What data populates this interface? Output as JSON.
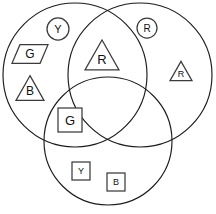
{
  "diagram": {
    "type": "venn-diagram",
    "background_color": "#ffffff",
    "outline_color": "#1b1b1b",
    "shape_outline_color": "#3b3b3b",
    "shape_fill_color": "#ffffff",
    "canvas": {
      "width": 216,
      "height": 214
    },
    "sets": [
      {
        "name": "left-circle",
        "cx": 75,
        "cy": 75,
        "r": 72
      },
      {
        "name": "right-circle",
        "cx": 140,
        "cy": 75,
        "r": 72
      },
      {
        "name": "bottom-circle",
        "cx": 108,
        "cy": 141,
        "r": 64
      }
    ],
    "objects": [
      {
        "id": "circle-y",
        "shape": "circle",
        "label": "Y",
        "region": "left-circle-only",
        "cx": 58,
        "cy": 29,
        "size": 22,
        "font_size": 11
      },
      {
        "id": "parallelogram-g",
        "shape": "parallelogram",
        "label": "G",
        "region": "left-circle-only",
        "cx": 30,
        "cy": 54,
        "size": 36,
        "font_size": 12
      },
      {
        "id": "triangle-b",
        "shape": "triangle",
        "label": "B",
        "region": "left-circle-only",
        "cx": 30,
        "cy": 88,
        "size": 28,
        "font_size": 12
      },
      {
        "id": "triangle-r-center",
        "shape": "triangle",
        "label": "R",
        "region": "left-right-intersection",
        "cx": 102,
        "cy": 55,
        "size": 34,
        "font_size": 13
      },
      {
        "id": "circle-r",
        "shape": "circle",
        "label": "R",
        "region": "right-circle-only",
        "cx": 147,
        "cy": 28,
        "size": 20,
        "font_size": 10
      },
      {
        "id": "triangle-r-right",
        "shape": "triangle",
        "label": "R",
        "region": "right-circle-only",
        "cx": 181,
        "cy": 71,
        "size": 22,
        "font_size": 9
      },
      {
        "id": "square-g",
        "shape": "square",
        "label": "G",
        "region": "left-bottom-intersection",
        "cx": 70,
        "cy": 120,
        "size": 24,
        "font_size": 13
      },
      {
        "id": "square-y",
        "shape": "square",
        "label": "Y",
        "region": "bottom-circle-only",
        "cx": 81,
        "cy": 171,
        "size": 18,
        "font_size": 9
      },
      {
        "id": "square-b",
        "shape": "square",
        "label": "B",
        "region": "bottom-circle-only",
        "cx": 116,
        "cy": 182,
        "size": 18,
        "font_size": 9
      }
    ]
  }
}
